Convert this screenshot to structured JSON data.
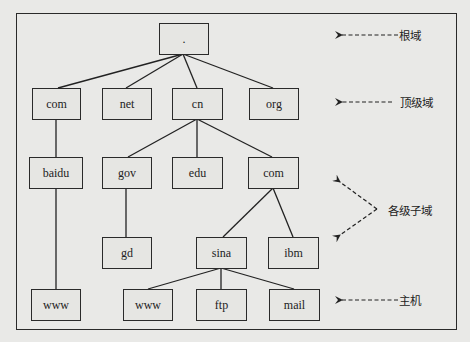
{
  "diagram": {
    "nodes": {
      "root": ".",
      "tld_com": "com",
      "tld_net": "net",
      "tld_cn": "cn",
      "tld_org": "org",
      "baidu": "baidu",
      "gov": "gov",
      "edu": "edu",
      "cn_com": "com",
      "gd": "gd",
      "sina": "sina",
      "ibm": "ibm",
      "baidu_www": "www",
      "sina_www": "www",
      "ftp": "ftp",
      "mail": "mail"
    },
    "edges": [
      [
        "root",
        "tld_com"
      ],
      [
        "root",
        "tld_net"
      ],
      [
        "root",
        "tld_cn"
      ],
      [
        "root",
        "tld_org"
      ],
      [
        "tld_com",
        "baidu"
      ],
      [
        "baidu",
        "baidu_www"
      ],
      [
        "tld_cn",
        "gov"
      ],
      [
        "tld_cn",
        "edu"
      ],
      [
        "tld_cn",
        "cn_com"
      ],
      [
        "gov",
        "gd"
      ],
      [
        "cn_com",
        "sina"
      ],
      [
        "cn_com",
        "ibm"
      ],
      [
        "sina",
        "sina_www"
      ],
      [
        "sina",
        "ftp"
      ],
      [
        "sina",
        "mail"
      ]
    ],
    "legend": {
      "root_domain": "根域",
      "top_level_domain": "顶级域",
      "subdomains": "各级子域",
      "host": "主机"
    }
  }
}
